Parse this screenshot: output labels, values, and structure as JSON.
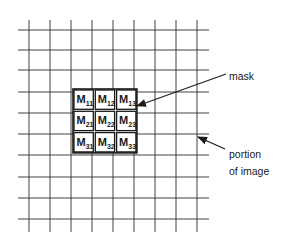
{
  "diagram": {
    "grid": {
      "vertical_lines_x": [
        29,
        50,
        71,
        92,
        113,
        134,
        155,
        176,
        197
      ],
      "horizontal_lines_y": [
        30,
        50,
        70,
        92,
        113,
        134,
        155,
        177,
        198,
        219
      ],
      "x_extent": [
        18,
        209
      ],
      "y_extent": [
        20,
        232
      ],
      "line_color": "#2a2a2a"
    },
    "mask": {
      "box": {
        "x": 73,
        "y": 89,
        "cell": 21.3,
        "rows": 3,
        "cols": 3
      },
      "cells": [
        {
          "row": 0,
          "col": 0,
          "base": "M",
          "sub": "11"
        },
        {
          "row": 0,
          "col": 1,
          "base": "M",
          "sub": "12"
        },
        {
          "row": 0,
          "col": 2,
          "base": "M",
          "sub": "13"
        },
        {
          "row": 1,
          "col": 0,
          "base": "M",
          "sub": "21"
        },
        {
          "row": 1,
          "col": 1,
          "base": "M",
          "sub": "22"
        },
        {
          "row": 1,
          "col": 2,
          "base": "M",
          "sub": "23"
        },
        {
          "row": 2,
          "col": 0,
          "base": "M",
          "sub": "31"
        },
        {
          "row": 2,
          "col": 1,
          "base": "M",
          "sub": "32"
        },
        {
          "row": 2,
          "col": 2,
          "base": "M",
          "sub": "33"
        }
      ]
    },
    "annotations": {
      "mask_label": "mask",
      "portion_label_line1": "portion",
      "portion_label_line2": "of image"
    },
    "arrows": [
      {
        "name": "mask-arrow",
        "from": [
          226,
          74
        ],
        "to": [
          137,
          106
        ]
      },
      {
        "name": "portion-arrow",
        "from": [
          225,
          149
        ],
        "to": [
          198,
          137
        ]
      }
    ]
  }
}
